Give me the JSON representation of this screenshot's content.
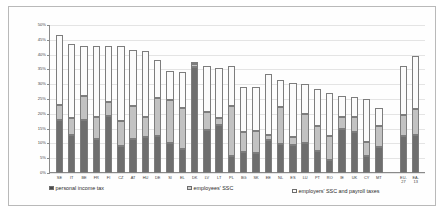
{
  "chart_data": {
    "type": "bar",
    "stacked": true,
    "title": "",
    "xlabel": "",
    "ylabel": "",
    "ylim": [
      0,
      50
    ],
    "yunit": "%",
    "grid": true,
    "legend_position": "bottom",
    "ytick_labels": [
      "0%",
      "5%",
      "10%",
      "15%",
      "20%",
      "25%",
      "30%",
      "35%",
      "40%",
      "45%",
      "50%"
    ],
    "ytick_values": [
      0,
      5,
      10,
      15,
      20,
      25,
      30,
      35,
      40,
      45,
      50
    ],
    "categories": [
      "SE",
      "IT",
      "BE",
      "FR",
      "FI",
      "CZ",
      "AT",
      "HU",
      "DE",
      "SI",
      "EL",
      "DK",
      "LV",
      "LT",
      "PL",
      "BG",
      "SK",
      "EE",
      "NL",
      "ES",
      "LU",
      "PT",
      "RO",
      "IE",
      "UK",
      "CY",
      "MT",
      "",
      "EU-\n27",
      "EA-\n13"
    ],
    "series": [
      {
        "name": "personal income tax",
        "color": "#6e6e6e",
        "values": [
          18.0,
          13.0,
          17.8,
          11.5,
          19.3,
          9.0,
          11.5,
          12.0,
          12.5,
          10.3,
          8.0,
          35.9,
          14.7,
          16.2,
          5.8,
          7.0,
          6.7,
          11.0,
          9.8,
          9.3,
          10.3,
          7.5,
          4.3,
          15.0,
          14.0,
          5.7,
          8.8,
          null,
          12.5,
          12.7
        ]
      },
      {
        "name": "employees' SSC",
        "color": "#c2c2c2",
        "values": [
          5.0,
          5.5,
          8.2,
          7.5,
          4.6,
          8.5,
          11.0,
          7.0,
          13.0,
          14.3,
          14.0,
          1.0,
          5.8,
          2.3,
          16.7,
          6.8,
          7.5,
          2.0,
          12.5,
          3.0,
          9.7,
          8.5,
          8.3,
          3.8,
          4.8,
          4.8,
          7.0,
          null,
          7.0,
          9.0
        ]
      },
      {
        "name": "employers' SSC and payroll taxes",
        "color": "#fbfbfb",
        "values": [
          23.7,
          25.0,
          17.0,
          24.0,
          19.0,
          25.5,
          19.0,
          22.2,
          12.8,
          10.0,
          12.0,
          0.6,
          15.5,
          17.0,
          13.5,
          15.4,
          14.8,
          20.5,
          9.0,
          18.2,
          10.0,
          12.5,
          14.4,
          7.2,
          7.0,
          14.5,
          6.2,
          null,
          16.5,
          17.8
        ]
      }
    ],
    "legend": [
      {
        "label": "personal income tax",
        "marker": "filled-square-dark"
      },
      {
        "label": "employees' SSC",
        "marker": "filled-square-light"
      },
      {
        "label": "employers' SSC and payroll taxes",
        "marker": "open-square"
      }
    ]
  }
}
